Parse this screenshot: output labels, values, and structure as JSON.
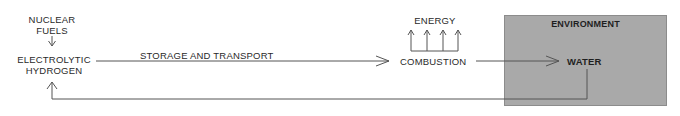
{
  "diagram": {
    "nodes": {
      "nuclear_fuels": "NUCLEAR\nFUELS",
      "nuclear_fuels_line1": "NUCLEAR",
      "nuclear_fuels_line2": "FUELS",
      "electrolytic_hydrogen_line1": "ELECTROLYTIC",
      "electrolytic_hydrogen_line2": "HYDROGEN",
      "energy": "ENERGY",
      "combustion": "COMBUSTION",
      "environment": "ENVIRONMENT",
      "water": "WATER"
    },
    "edges": [
      {
        "from": "NUCLEAR FUELS",
        "to": "ELECTROLYTIC HYDROGEN",
        "label": ""
      },
      {
        "from": "ELECTROLYTIC HYDROGEN",
        "to": "COMBUSTION",
        "label": "STORAGE AND TRANSPORT"
      },
      {
        "from": "COMBUSTION",
        "to": "ENERGY",
        "label": "",
        "arrow_count": 4
      },
      {
        "from": "COMBUSTION",
        "to": "WATER",
        "label": ""
      },
      {
        "from": "WATER",
        "to": "ELECTROLYTIC HYDROGEN",
        "label": ""
      }
    ],
    "edge_labels": {
      "storage_transport": "STORAGE AND TRANSPORT"
    },
    "colors": {
      "environment_fill": "#a9a9a9",
      "line": "#555555",
      "text": "#2a2a2a"
    }
  }
}
